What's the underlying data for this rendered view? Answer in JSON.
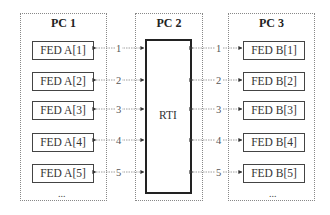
{
  "diagram": {
    "panels": [
      {
        "id": "pc1",
        "title": "PC 1"
      },
      {
        "id": "pc2",
        "title": "PC 2"
      },
      {
        "id": "pc3",
        "title": "PC 3"
      }
    ],
    "rti": {
      "label": "RTI"
    },
    "left_federates": [
      "FED A[1]",
      "FED A[2]",
      "FED A[3]",
      "FED A[4]",
      "FED A[5]"
    ],
    "right_federates": [
      "FED B[1]",
      "FED B[2]",
      "FED B[3]",
      "FED B[4]",
      "FED B[5]"
    ],
    "connection_labels": [
      "1",
      "2",
      "3",
      "4",
      "5"
    ],
    "ellipsis": "..."
  }
}
